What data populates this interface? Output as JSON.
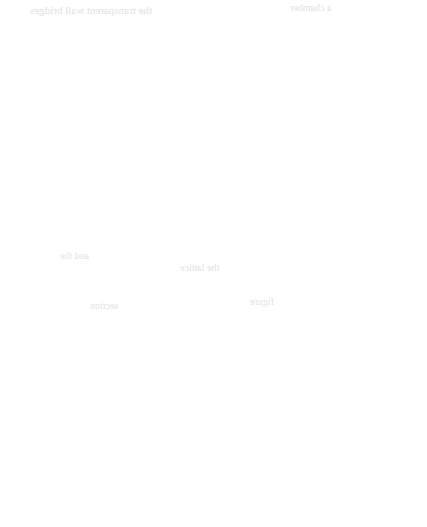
{
  "figure": {
    "name": "hexagonal-triangular-lattice",
    "caption": "",
    "background_color": "#ffffff",
    "line_color": "#4a4a4a",
    "channel_fill_color": "#ffffff",
    "dot_color": "#111111",
    "line_width": 1.1,
    "channel_width": 5.6,
    "dot_radius": 4.6
  },
  "geometry": {
    "center": {
      "x": 214,
      "y": 263.5
    },
    "cell_side": 95,
    "row_height": 82.3,
    "hex_left_x": 24,
    "hex_right_x": 404,
    "hex_top_y": 47,
    "hex_bottom_y": 480,
    "vertex_fillet_radius": 7,
    "stem_top_y": 0,
    "stem_bottom_y": 527
  },
  "lattice": {
    "description": "Hexagon of 12 unit triangles formed by double-walled channels",
    "triangle_count": 12,
    "outer_vertices": [
      {
        "id": "v-top-left",
        "x": 24,
        "y": 182
      },
      {
        "id": "v-top-mid-left",
        "x": 119,
        "y": 99
      },
      {
        "id": "v-top",
        "x": 214,
        "y": 47
      },
      {
        "id": "v-top-mid-right",
        "x": 309,
        "y": 99
      },
      {
        "id": "v-top-right",
        "x": 404,
        "y": 182
      },
      {
        "id": "v-right",
        "x": 404,
        "y": 263
      },
      {
        "id": "v-bot-right",
        "x": 404,
        "y": 345
      },
      {
        "id": "v-bot-mid-right",
        "x": 309,
        "y": 428
      },
      {
        "id": "v-bottom",
        "x": 214,
        "y": 480
      },
      {
        "id": "v-bot-mid-left",
        "x": 119,
        "y": 428
      },
      {
        "id": "v-bot-left",
        "x": 24,
        "y": 345
      },
      {
        "id": "v-left",
        "x": 24,
        "y": 263
      }
    ],
    "interior_vertices": [
      {
        "id": "i-upper-center",
        "x": 214,
        "y": 181
      },
      {
        "id": "i-mid-left",
        "x": 119,
        "y": 263
      },
      {
        "id": "i-mid-right",
        "x": 309,
        "y": 263
      },
      {
        "id": "i-lower-center",
        "x": 214,
        "y": 346
      }
    ],
    "stems": [
      {
        "id": "stem-top",
        "from_x": 214,
        "from_y": 47,
        "to_x": 214,
        "to_y": 0
      },
      {
        "id": "stem-bottom",
        "from_x": 214,
        "from_y": 480,
        "to_x": 214,
        "to_y": 527
      }
    ]
  },
  "dots": [
    {
      "id": "dot-01",
      "x": 166,
      "y": 118,
      "segment": "upper-left-inner-diagonal"
    },
    {
      "id": "dot-02",
      "x": 261,
      "y": 118,
      "segment": "upper-right-inner-diagonal"
    },
    {
      "id": "dot-03",
      "x": 356,
      "y": 173,
      "segment": "upper-right-outer-diagonal"
    },
    {
      "id": "dot-04",
      "x": 24,
      "y": 201,
      "segment": "left-outer-vertical-upper"
    },
    {
      "id": "dot-05",
      "x": 214,
      "y": 202,
      "segment": "center-vertical-upper"
    },
    {
      "id": "dot-06",
      "x": 166,
      "y": 226,
      "segment": "center-left-diagonal"
    },
    {
      "id": "dot-07",
      "x": 214,
      "y": 310,
      "segment": "center-vertical-lower"
    },
    {
      "id": "dot-08",
      "x": 73,
      "y": 338,
      "segment": "lower-left-diagonal"
    },
    {
      "id": "dot-09",
      "x": 356,
      "y": 336,
      "segment": "lower-right-diagonal"
    },
    {
      "id": "dot-10",
      "x": 167,
      "y": 392,
      "segment": "bottom-left-inner-diagonal"
    },
    {
      "id": "dot-11",
      "x": 262,
      "y": 392,
      "segment": "bottom-right-inner-diagonal"
    },
    {
      "id": "dot-12",
      "x": 356,
      "y": 392,
      "segment": "bottom-right-outer-diagonal"
    }
  ],
  "scan_artifacts": {
    "note": "faint mirrored show-through text from reverse of scanned page",
    "lines": [
      {
        "text": "the transparent wall bridges",
        "x": 30,
        "y": 4,
        "size": 11
      },
      {
        "text": "a chamber",
        "x": 290,
        "y": 2,
        "size": 10
      },
      {
        "text": "and the",
        "x": 60,
        "y": 250,
        "size": 10
      },
      {
        "text": "the lattice",
        "x": 180,
        "y": 262,
        "size": 10
      },
      {
        "text": "section",
        "x": 90,
        "y": 300,
        "size": 10
      },
      {
        "text": "figure",
        "x": 250,
        "y": 296,
        "size": 10
      }
    ]
  }
}
